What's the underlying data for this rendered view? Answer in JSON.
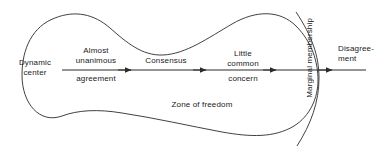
{
  "diagram": {
    "stroke_color": "#2b2b2b",
    "text_color": "#1a1a1a",
    "background_color": "#ffffff",
    "labels": {
      "dynamic_center_line1": "Dynamic",
      "dynamic_center_line2": "center",
      "almost_line1": "Almost",
      "almost_line2": "unanimous",
      "almost_line3": "agreement",
      "consensus": "Consensus",
      "little_line1": "Little",
      "little_line2": "common",
      "little_line3": "concern",
      "zone_of_freedom": "Zone of freedom",
      "marginal_membership": "Marginal membership",
      "disagreement_line1": "Disagree-",
      "disagreement_line2": "ment"
    },
    "axis": {
      "start_x": 62,
      "end_x": 366,
      "y": 70,
      "arrow_count": 4,
      "arrow_positions": [
        130,
        205,
        275,
        331
      ]
    }
  }
}
